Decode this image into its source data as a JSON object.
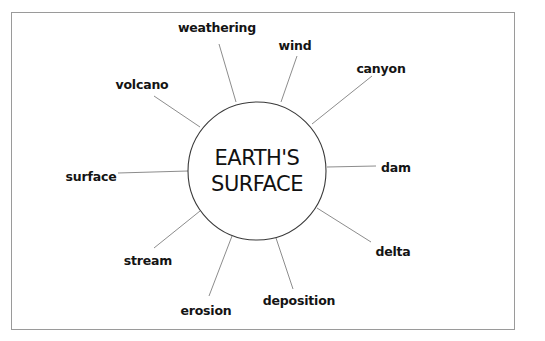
{
  "diagram": {
    "type": "concept-web",
    "center": {
      "line1": "EARTH'S",
      "line2": "SURFACE",
      "cx": 257,
      "cy": 171,
      "r": 69
    },
    "nodes": [
      {
        "label": "weathering",
        "x": 217,
        "y": 28,
        "line": [
          219,
          44,
          236,
          102
        ]
      },
      {
        "label": "wind",
        "x": 295,
        "y": 46,
        "line": [
          297,
          56,
          281,
          102
        ]
      },
      {
        "label": "canyon",
        "x": 381,
        "y": 69,
        "line": [
          372,
          76,
          312,
          124
        ]
      },
      {
        "label": "volcano",
        "x": 142,
        "y": 85,
        "line": [
          154,
          96,
          200,
          127
        ]
      },
      {
        "label": "surface",
        "x": 91,
        "y": 177,
        "line": [
          118,
          173,
          188,
          171
        ]
      },
      {
        "label": "dam",
        "x": 396,
        "y": 168,
        "line": [
          376,
          166,
          327,
          167
        ]
      },
      {
        "label": "delta",
        "x": 393,
        "y": 252,
        "line": [
          371,
          242,
          317,
          208
        ]
      },
      {
        "label": "stream",
        "x": 148,
        "y": 261,
        "line": [
          154,
          248,
          200,
          211
        ]
      },
      {
        "label": "erosion",
        "x": 206,
        "y": 311,
        "line": [
          209,
          296,
          232,
          236
        ]
      },
      {
        "label": "deposition",
        "x": 299,
        "y": 301,
        "line": [
          293,
          289,
          276,
          238
        ]
      }
    ],
    "colors": {
      "border": "#9a9a9a",
      "spoke": "#6e6e6e",
      "hub_stroke": "#3a3a3a",
      "text": "#141414"
    }
  }
}
